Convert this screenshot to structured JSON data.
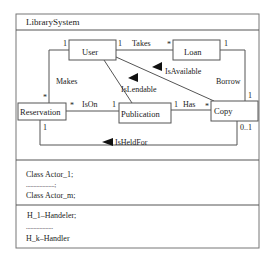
{
  "package": {
    "title": "LibrarySystem"
  },
  "classes": {
    "user": "User",
    "loan": "Loan",
    "reservation": "Reservation",
    "publication": "Publication",
    "copy": "Copy"
  },
  "associations": {
    "takes": {
      "label": "Takes",
      "mult_user": "1",
      "mult_loan": "*"
    },
    "borrow": {
      "label": "Borrow",
      "mult_loan": "1",
      "mult_copy": "1"
    },
    "makes": {
      "label": "Makes",
      "mult_user": "1",
      "mult_reservation": "*"
    },
    "is_available": {
      "label": "IsAvailable",
      "direction_icon": "triangle-left"
    },
    "is_lendable": {
      "label": "IsLendable",
      "direction_icon": "triangle-left"
    },
    "is_on": {
      "label": "IsOn",
      "mult_reservation": "*",
      "mult_publication": "1"
    },
    "has": {
      "label": "Has",
      "mult_publication": "1",
      "mult_copy": "*"
    },
    "is_held_for": {
      "label": "IsHeldFor",
      "mult_reservation": "1",
      "mult_copy": "0..1",
      "direction_icon": "triangle-left"
    }
  },
  "actors_section": {
    "line1": "Class Actor_1;",
    "dots": "...................;",
    "line2": "Class Actor_m;"
  },
  "handlers_section": {
    "line1": "H_1–Handeler;",
    "dots": "..................",
    "line2": "H_k–Handler"
  }
}
